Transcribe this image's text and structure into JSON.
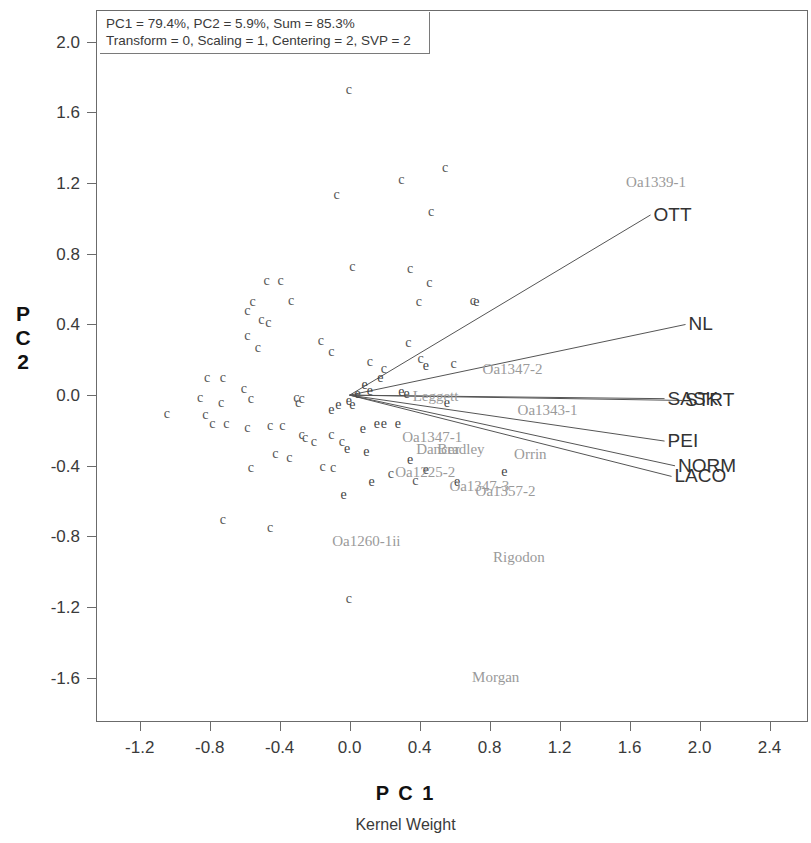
{
  "annotation": {
    "line1": "PC1 = 79.4%, PC2 = 5.9%, Sum = 85.3%",
    "line2": "Transform = 0, Scaling = 1, Centering = 2, SVP = 2"
  },
  "axes": {
    "y_title": "P C 2",
    "x_title": "P C 1",
    "subtitle": "Kernel Weight",
    "y_ticks": [
      "2.0",
      "1.6",
      "1.2",
      "0.8",
      "0.4",
      "0.0",
      "-0.4",
      "-0.8",
      "-1.2",
      "-1.6"
    ],
    "x_ticks": [
      "-1.2",
      "-0.8",
      "-0.4",
      "0.0",
      "0.4",
      "0.8",
      "1.2",
      "1.6",
      "2.0",
      "2.4"
    ],
    "x_range": [
      -1.45,
      2.62
    ],
    "y_range": [
      -1.85,
      2.18
    ]
  },
  "chart_data": {
    "type": "scatter",
    "title": "PC1 = 79.4%, PC2 = 5.9%, Sum = 85.3%",
    "subtitle": "Kernel Weight",
    "xlabel": "P C 1",
    "ylabel": "P C 2",
    "xlim": [
      -1.45,
      2.62
    ],
    "ylim": [
      -1.85,
      2.18
    ],
    "xticks": [
      -1.2,
      -0.8,
      -0.4,
      0.0,
      0.4,
      0.8,
      1.2,
      1.6,
      2.0,
      2.4
    ],
    "yticks": [
      2.0,
      1.6,
      1.2,
      0.8,
      0.4,
      0.0,
      -0.4,
      -0.8,
      -1.2,
      -1.6
    ],
    "grid": false,
    "legend": "none",
    "origin": [
      0.0,
      0.0
    ],
    "series": [
      {
        "name": "genotypes",
        "marker": "c",
        "points": [
          [
            0.0,
            1.72
          ],
          [
            -0.07,
            1.13
          ],
          [
            0.3,
            1.21
          ],
          [
            0.55,
            1.28
          ],
          [
            0.47,
            1.03
          ],
          [
            0.02,
            0.72
          ],
          [
            0.35,
            0.71
          ],
          [
            0.46,
            0.63
          ],
          [
            -0.47,
            0.64
          ],
          [
            -0.39,
            0.64
          ],
          [
            -0.55,
            0.52
          ],
          [
            -0.58,
            0.47
          ],
          [
            -0.5,
            0.42
          ],
          [
            -0.46,
            0.4
          ],
          [
            -0.33,
            0.53
          ],
          [
            0.4,
            0.52
          ],
          [
            0.71,
            0.53
          ],
          [
            -0.58,
            0.33
          ],
          [
            -0.52,
            0.26
          ],
          [
            -0.16,
            0.3
          ],
          [
            -0.1,
            0.24
          ],
          [
            0.34,
            0.29
          ],
          [
            0.41,
            0.2
          ],
          [
            0.12,
            0.18
          ],
          [
            0.2,
            0.14
          ],
          [
            0.6,
            0.17
          ],
          [
            -0.81,
            0.09
          ],
          [
            -0.72,
            0.09
          ],
          [
            -0.85,
            -0.02
          ],
          [
            -0.73,
            -0.05
          ],
          [
            -0.6,
            0.03
          ],
          [
            -0.56,
            -0.03
          ],
          [
            -1.04,
            -0.11
          ],
          [
            -0.3,
            -0.02
          ],
          [
            -0.27,
            -0.03
          ],
          [
            -0.29,
            -0.05
          ],
          [
            -0.82,
            -0.12
          ],
          [
            -0.78,
            -0.17
          ],
          [
            -0.7,
            -0.17
          ],
          [
            -0.58,
            -0.19
          ],
          [
            -0.45,
            -0.18
          ],
          [
            -0.38,
            -0.18
          ],
          [
            -0.27,
            -0.23
          ],
          [
            -0.25,
            -0.25
          ],
          [
            -0.2,
            -0.27
          ],
          [
            -0.1,
            -0.23
          ],
          [
            -0.04,
            -0.27
          ],
          [
            -0.42,
            -0.34
          ],
          [
            -0.34,
            -0.36
          ],
          [
            -0.56,
            -0.42
          ],
          [
            -0.15,
            -0.41
          ],
          [
            -0.09,
            -0.42
          ],
          [
            0.24,
            -0.45
          ],
          [
            0.38,
            -0.49
          ],
          [
            -0.72,
            -0.71
          ],
          [
            -0.45,
            -0.76
          ],
          [
            0.0,
            -1.16
          ]
        ]
      },
      {
        "name": "environments",
        "marker": "e",
        "points": [
          [
            0.73,
            0.52
          ],
          [
            0.44,
            0.16
          ],
          [
            0.18,
            0.09
          ],
          [
            0.09,
            0.05
          ],
          [
            0.12,
            0.02
          ],
          [
            0.3,
            0.01
          ],
          [
            0.33,
            0.0
          ],
          [
            0.05,
            0.0
          ],
          [
            0.0,
            -0.04
          ],
          [
            -0.06,
            -0.06
          ],
          [
            -0.1,
            -0.09
          ],
          [
            0.02,
            -0.06
          ],
          [
            0.56,
            -0.05
          ],
          [
            0.16,
            -0.17
          ],
          [
            0.2,
            -0.17
          ],
          [
            0.08,
            -0.2
          ],
          [
            0.28,
            -0.17
          ],
          [
            -0.01,
            -0.31
          ],
          [
            0.1,
            -0.33
          ],
          [
            0.35,
            -0.37
          ],
          [
            0.44,
            -0.43
          ],
          [
            0.89,
            -0.44
          ],
          [
            0.62,
            -0.5
          ],
          [
            0.13,
            -0.5
          ],
          [
            -0.03,
            -0.57
          ]
        ]
      }
    ],
    "vectors": [
      {
        "label": "OTT",
        "x": 1.72,
        "y": 1.02
      },
      {
        "label": "NL",
        "x": 1.92,
        "y": 0.4
      },
      {
        "label": "SASK",
        "x": 1.8,
        "y": -0.02
      },
      {
        "label": "STRT",
        "x": 1.9,
        "y": -0.03
      },
      {
        "label": "PEI",
        "x": 1.8,
        "y": -0.26
      },
      {
        "label": "NORM",
        "x": 1.86,
        "y": -0.4
      },
      {
        "label": "LACO",
        "x": 1.84,
        "y": -0.46
      }
    ],
    "genotype_labels": [
      {
        "text": "Oa1339-1",
        "x": 1.58,
        "y": 1.2
      },
      {
        "text": "Oa1347-2",
        "x": 0.76,
        "y": 0.14
      },
      {
        "text": "Leggett",
        "x": 0.36,
        "y": -0.01
      },
      {
        "text": "Oa1343-1",
        "x": 0.96,
        "y": -0.09
      },
      {
        "text": "Oa1347-1",
        "x": 0.3,
        "y": -0.24
      },
      {
        "text": "Dancer",
        "x": 0.38,
        "y": -0.31
      },
      {
        "text": "Bradley",
        "x": 0.5,
        "y": -0.31
      },
      {
        "text": "Orrin",
        "x": 0.94,
        "y": -0.34
      },
      {
        "text": "Oa1225-2",
        "x": 0.26,
        "y": -0.44
      },
      {
        "text": "Oa1347-3",
        "x": 0.57,
        "y": -0.52
      },
      {
        "text": "Oa1357-2",
        "x": 0.72,
        "y": -0.55
      },
      {
        "text": "Oa1260-1ii",
        "x": -0.1,
        "y": -0.83
      },
      {
        "text": "Rigodon",
        "x": 0.82,
        "y": -0.92
      },
      {
        "text": "Morgan",
        "x": 0.7,
        "y": -1.6
      }
    ]
  }
}
